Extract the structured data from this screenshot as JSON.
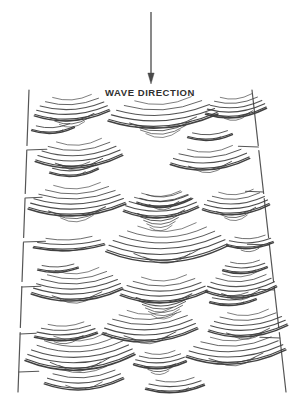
{
  "figure": {
    "type": "geological-diagram",
    "background_color": "#ffffff",
    "line_color": "#3d3d3d",
    "frame_color": "#555555",
    "label_color": "#2f2f2f",
    "width": 308,
    "height": 400
  },
  "annotation": {
    "wave_direction_label": "WAVE DIRECTION",
    "label_x": 150,
    "label_y": 96,
    "arrow": {
      "name": "wave-direction-arrow",
      "x": 151,
      "y_start": 12,
      "y_end": 84,
      "head_length": 11,
      "head_half_width": 3.2,
      "stroke_width": 1.3,
      "color": "#4a4a4a"
    }
  },
  "frame": {
    "name": "outcrop-frame",
    "shape": "trapezoid",
    "top_left_x": 29,
    "top_right_x": 252,
    "bottom_left_x": 18,
    "bottom_right_x": 286,
    "top_y": 90,
    "bottom_y": 392,
    "stroke_width": 1.2,
    "color": "#555555",
    "gaps": [
      {
        "y": 148,
        "size": 5
      },
      {
        "y": 196,
        "size": 5
      },
      {
        "y": 240,
        "size": 5
      },
      {
        "y": 284,
        "size": 5
      },
      {
        "y": 330,
        "size": 5
      }
    ],
    "tick_marks": [
      {
        "side": "left",
        "y": 150,
        "length": 20
      },
      {
        "side": "left",
        "y": 198,
        "length": 17
      },
      {
        "side": "left",
        "y": 242,
        "length": 22
      },
      {
        "side": "left",
        "y": 287,
        "length": 19
      },
      {
        "side": "left",
        "y": 334,
        "length": 16
      },
      {
        "side": "left",
        "y": 372,
        "length": 20
      },
      {
        "side": "right",
        "y": 147,
        "length": 20
      },
      {
        "side": "right",
        "y": 192,
        "length": 18
      },
      {
        "side": "right",
        "y": 245,
        "length": 22
      },
      {
        "side": "right",
        "y": 290,
        "length": 16
      },
      {
        "side": "right",
        "y": 338,
        "length": 20
      }
    ]
  },
  "ripples": [
    {
      "cx": 72,
      "cy": 112,
      "w": 74,
      "up": 5,
      "down": 3,
      "sag": 7,
      "tilt": -2.5,
      "gap": 4.0
    },
    {
      "cx": 163,
      "cy": 116,
      "w": 108,
      "up": 5,
      "down": 4,
      "sag": 10,
      "tilt": -3.5,
      "gap": 4.3
    },
    {
      "cx": 236,
      "cy": 110,
      "w": 60,
      "up": 5,
      "down": 2,
      "sag": 6,
      "tilt": -3.0,
      "gap": 3.6
    },
    {
      "cx": 79,
      "cy": 157,
      "w": 86,
      "up": 5,
      "down": 2,
      "sag": 9,
      "tilt": -3.0,
      "gap": 4.2
    },
    {
      "cx": 210,
      "cy": 160,
      "w": 78,
      "up": 4,
      "down": 2,
      "sag": 8,
      "tilt": -3.0,
      "gap": 4.2
    },
    {
      "cx": 74,
      "cy": 170,
      "w": 48,
      "up": 3,
      "down": 1,
      "sag": 5,
      "tilt": -2.0,
      "gap": 3.4
    },
    {
      "cx": 77,
      "cy": 205,
      "w": 96,
      "up": 6,
      "down": 3,
      "sag": 9,
      "tilt": -2.5,
      "gap": 4.2
    },
    {
      "cx": 161,
      "cy": 208,
      "w": 74,
      "up": 5,
      "down": 5,
      "sag": 8,
      "tilt": -2.0,
      "gap": 4.0
    },
    {
      "cx": 236,
      "cy": 206,
      "w": 66,
      "up": 5,
      "down": 3,
      "sag": 7,
      "tilt": -2.5,
      "gap": 3.8
    },
    {
      "cx": 164,
      "cy": 200,
      "w": 54,
      "up": 3,
      "down": 2,
      "sag": 6,
      "tilt": -2.0,
      "gap": 3.4
    },
    {
      "cx": 69,
      "cy": 245,
      "w": 70,
      "up": 3,
      "down": 1,
      "sag": 4,
      "tilt": -1.5,
      "gap": 3.8
    },
    {
      "cx": 167,
      "cy": 247,
      "w": 120,
      "up": 6,
      "down": 2,
      "sag": 13,
      "tilt": -3.0,
      "gap": 4.5
    },
    {
      "cx": 250,
      "cy": 243,
      "w": 46,
      "up": 3,
      "down": 2,
      "sag": 4,
      "tilt": -1.5,
      "gap": 3.4
    },
    {
      "cx": 77,
      "cy": 290,
      "w": 90,
      "up": 6,
      "down": 2,
      "sag": 9,
      "tilt": -2.5,
      "gap": 4.2
    },
    {
      "cx": 164,
      "cy": 292,
      "w": 86,
      "up": 5,
      "down": 6,
      "sag": 9,
      "tilt": -2.0,
      "gap": 4.0
    },
    {
      "cx": 241,
      "cy": 288,
      "w": 70,
      "up": 5,
      "down": 2,
      "sag": 8,
      "tilt": -2.5,
      "gap": 3.9
    },
    {
      "cx": 66,
      "cy": 334,
      "w": 62,
      "up": 4,
      "down": 2,
      "sag": 5,
      "tilt": -2.0,
      "gap": 3.6
    },
    {
      "cx": 150,
      "cy": 330,
      "w": 94,
      "up": 6,
      "down": 2,
      "sag": 10,
      "tilt": -2.5,
      "gap": 4.2
    },
    {
      "cx": 248,
      "cy": 327,
      "w": 78,
      "up": 5,
      "down": 2,
      "sag": 8,
      "tilt": -3.0,
      "gap": 4.0
    },
    {
      "cx": 233,
      "cy": 300,
      "w": 46,
      "up": 3,
      "down": 1,
      "sag": 4,
      "tilt": -1.5,
      "gap": 3.4
    },
    {
      "cx": 80,
      "cy": 356,
      "w": 108,
      "up": 6,
      "down": 2,
      "sag": 12,
      "tilt": -3.0,
      "gap": 4.3
    },
    {
      "cx": 160,
      "cy": 362,
      "w": 52,
      "up": 4,
      "down": 3,
      "sag": 5,
      "tilt": -1.5,
      "gap": 3.5
    },
    {
      "cx": 236,
      "cy": 352,
      "w": 98,
      "up": 5,
      "down": 2,
      "sag": 10,
      "tilt": -3.5,
      "gap": 4.2
    },
    {
      "cx": 84,
      "cy": 380,
      "w": 78,
      "up": 4,
      "down": 1,
      "sag": 8,
      "tilt": -2.5,
      "gap": 4.0
    },
    {
      "cx": 175,
      "cy": 386,
      "w": 58,
      "up": 3,
      "down": 1,
      "sag": 5,
      "tilt": -2.0,
      "gap": 3.6
    },
    {
      "cx": 53,
      "cy": 128,
      "w": 42,
      "up": 2,
      "down": 1,
      "sag": 4,
      "tilt": -1.5,
      "gap": 3.2
    },
    {
      "cx": 210,
      "cy": 135,
      "w": 44,
      "up": 2,
      "down": 1,
      "sag": 4,
      "tilt": -1.5,
      "gap": 3.2
    },
    {
      "cx": 58,
      "cy": 268,
      "w": 40,
      "up": 2,
      "down": 1,
      "sag": 3,
      "tilt": -1.0,
      "gap": 3.2
    },
    {
      "cx": 245,
      "cy": 268,
      "w": 44,
      "up": 3,
      "down": 1,
      "sag": 4,
      "tilt": -1.5,
      "gap": 3.4
    }
  ]
}
